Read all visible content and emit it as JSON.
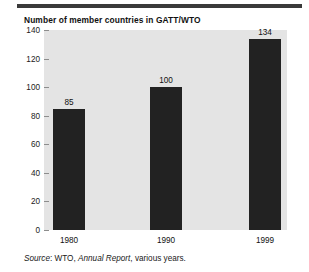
{
  "chart_data": {
    "type": "bar",
    "title": "Number of member countries in GATT/WTO",
    "categories": [
      "1980",
      "1990",
      "1999"
    ],
    "values": [
      85,
      100,
      134
    ],
    "xlabel": "",
    "ylabel": "",
    "ylim": [
      0,
      140
    ],
    "yticks": [
      0,
      20,
      40,
      60,
      80,
      100,
      120,
      140
    ],
    "ytick_labels": [
      "0",
      "20",
      "40",
      "60",
      "80",
      "100",
      "120",
      "140"
    ],
    "grid": false,
    "legend": false,
    "data_labels": [
      "85",
      "100",
      "134"
    ],
    "bar_color": "#222222",
    "plot_background": "#e4e4e4"
  },
  "source": {
    "label": "Source",
    "separator": ": ",
    "publisher": "WTO, ",
    "publication": "Annual Report",
    "suffix": ", various years."
  },
  "decor": {
    "top_rule_color": "#3a3a3a"
  }
}
